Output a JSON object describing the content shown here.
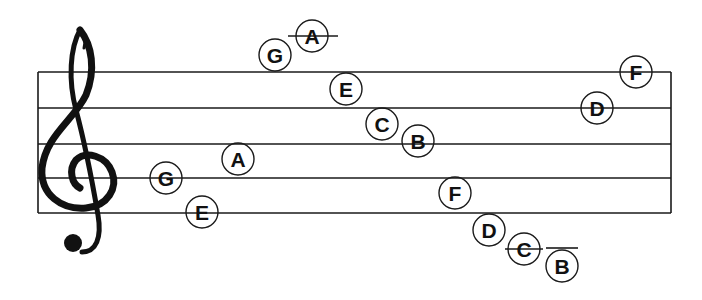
{
  "diagram": {
    "colors": {
      "ink": "#1a1a1a",
      "background": "#ffffff"
    },
    "staff": {
      "lines_y": [
        72,
        108,
        144,
        178,
        213
      ],
      "left_x": 38,
      "right_x": 671,
      "clef": "treble-clef"
    },
    "notes": [
      {
        "label": "G",
        "cx": 166,
        "cy": 178,
        "position": "line 2 (G4)"
      },
      {
        "label": "E",
        "cx": 202,
        "cy": 212,
        "position": "line 1 (E4)"
      },
      {
        "label": "A",
        "cx": 238,
        "cy": 159,
        "position": "space 2 (A4)"
      },
      {
        "label": "G",
        "cx": 275,
        "cy": 55,
        "position": "space above staff (G5)"
      },
      {
        "label": "A",
        "cx": 312,
        "cy": 36,
        "position": "ledger line above (A5)",
        "ledger": [
          288,
          338
        ]
      },
      {
        "label": "E",
        "cx": 346,
        "cy": 89,
        "position": "space 4 (E5)"
      },
      {
        "label": "C",
        "cx": 382,
        "cy": 124,
        "position": "space 3 (C5)"
      },
      {
        "label": "B",
        "cx": 418,
        "cy": 141,
        "position": "line 3 (B4)"
      },
      {
        "label": "F",
        "cx": 455,
        "cy": 193,
        "position": "space 1 (F4)"
      },
      {
        "label": "D",
        "cx": 489,
        "cy": 230,
        "position": "space below staff (D4)"
      },
      {
        "label": "C",
        "cx": 524,
        "cy": 249,
        "position": "ledger line below (C4)",
        "ledger": [
          505,
          543
        ]
      },
      {
        "label": "B",
        "cx": 562,
        "cy": 266,
        "position": "below ledger line (B3)",
        "ledger": [
          546,
          578
        ],
        "ledger_y": 248
      },
      {
        "label": "D",
        "cx": 597,
        "cy": 108,
        "position": "line 4 (D5)"
      },
      {
        "label": "F",
        "cx": 636,
        "cy": 72,
        "position": "line 5 (F5)"
      }
    ]
  }
}
